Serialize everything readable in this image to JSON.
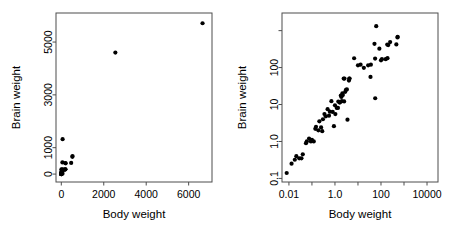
{
  "figure": {
    "background": "#ffffff",
    "point_color": "#000000",
    "axis_color": "#4d4d4d",
    "point_radius_px": 2.1
  },
  "chart_data": [
    {
      "id": "left-panel",
      "type": "scatter",
      "title": "",
      "xlabel": "Body weight",
      "ylabel": "Brain weight",
      "xscale": "linear",
      "yscale": "linear",
      "xlim": [
        -250,
        7100
      ],
      "ylim": [
        -300,
        6100
      ],
      "xticks": [
        0,
        2000,
        4000,
        6000
      ],
      "xticklabels": [
        "0",
        "2000",
        "4000",
        "6000"
      ],
      "yticks": [
        0,
        1000,
        3000,
        5000
      ],
      "yticklabels": [
        "0",
        "1000",
        "3000",
        "5000"
      ],
      "grid": false,
      "legend": null,
      "points": [
        [
          1.35,
          8.1
        ],
        [
          465,
          423
        ],
        [
          36.33,
          119.5
        ],
        [
          27.66,
          115
        ],
        [
          1.04,
          5.5
        ],
        [
          11700,
          50
        ],
        [
          2547,
          4603
        ],
        [
          187.1,
          419
        ],
        [
          521,
          655
        ],
        [
          10,
          115
        ],
        [
          3.3,
          25.6
        ],
        [
          529,
          680
        ],
        [
          207,
          406
        ],
        [
          62,
          1320
        ],
        [
          6654,
          5712
        ],
        [
          9400,
          70
        ],
        [
          6.8,
          179
        ],
        [
          35,
          56
        ],
        [
          0.12,
          1
        ],
        [
          0.023,
          0.4
        ],
        [
          2.5,
          12.1
        ],
        [
          55.5,
          175
        ],
        [
          100,
          157
        ],
        [
          52.16,
          440
        ],
        [
          87000,
          154.5
        ],
        [
          0.28,
          1.9
        ],
        [
          56,
          14.8
        ],
        [
          192,
          180
        ],
        [
          3,
          25
        ],
        [
          4.288,
          50.4
        ],
        [
          0.075,
          1.2
        ],
        [
          0.122,
          3
        ],
        [
          192,
          180
        ],
        [
          160,
          169
        ],
        [
          2.4,
          50.4
        ],
        [
          0.9,
          2.6
        ],
        [
          1.62,
          11.4
        ],
        [
          0.104,
          2.5
        ],
        [
          4.235,
          50.4
        ]
      ],
      "n_points": 39,
      "note": "Animals dataset: body weight (kg) vs brain weight (g)"
    },
    {
      "id": "right-panel",
      "type": "scatter",
      "title": "",
      "xlabel": "Body weight",
      "ylabel": "Brain weight",
      "xscale": "log",
      "yscale": "log",
      "xlim": [
        0.005,
        30000
      ],
      "ylim": [
        0.08,
        3000
      ],
      "xticks": [
        0.01,
        1.0,
        100,
        10000
      ],
      "xticklabels": [
        "0.01",
        "1.0",
        "100",
        "10000"
      ],
      "xticks_minor": [
        0.1,
        10,
        1000
      ],
      "yticks": [
        0.1,
        1.0,
        10,
        100
      ],
      "yticklabels": [
        "0.1",
        "1.0",
        "10",
        "100"
      ],
      "yticks_minor": [
        1000
      ],
      "grid": false,
      "legend": null,
      "points": [
        [
          0.008,
          0.14
        ],
        [
          0.013,
          0.25
        ],
        [
          0.018,
          0.32
        ],
        [
          0.021,
          0.4
        ],
        [
          0.028,
          0.35
        ],
        [
          0.035,
          0.35
        ],
        [
          0.04,
          0.45
        ],
        [
          0.055,
          0.9
        ],
        [
          0.06,
          1.0
        ],
        [
          0.075,
          1.2
        ],
        [
          0.09,
          1.0
        ],
        [
          0.1,
          1.1
        ],
        [
          0.12,
          1.0
        ],
        [
          0.14,
          2.2
        ],
        [
          0.15,
          2.5
        ],
        [
          0.19,
          2.0
        ],
        [
          0.21,
          3.5
        ],
        [
          0.25,
          2.4
        ],
        [
          0.28,
          1.9
        ],
        [
          0.3,
          4.0
        ],
        [
          0.35,
          5.5
        ],
        [
          0.4,
          4.8
        ],
        [
          0.48,
          7.5
        ],
        [
          0.55,
          5.0
        ],
        [
          0.6,
          6.4
        ],
        [
          0.7,
          12.3
        ],
        [
          0.8,
          6.3
        ],
        [
          0.9,
          2.6
        ],
        [
          1.0,
          9.5
        ],
        [
          1.04,
          5.5
        ],
        [
          1.2,
          8.1
        ],
        [
          1.35,
          8.1
        ],
        [
          1.4,
          12.0
        ],
        [
          1.6,
          11.4
        ],
        [
          1.62,
          11.4
        ],
        [
          1.8,
          17.5
        ],
        [
          1.9,
          16.0
        ],
        [
          2.0,
          12.3
        ],
        [
          2.1,
          20.0
        ],
        [
          2.2,
          18.0
        ],
        [
          2.4,
          50.4
        ],
        [
          2.5,
          12.1
        ],
        [
          2.6,
          50.4
        ],
        [
          2.8,
          22.0
        ],
        [
          3.0,
          25.0
        ],
        [
          3.3,
          25.6
        ],
        [
          3.5,
          3.9
        ],
        [
          4.05,
          44.5
        ],
        [
          4.23,
          50.4
        ],
        [
          4.29,
          50.4
        ],
        [
          6.8,
          179.0
        ],
        [
          10.0,
          115.0
        ],
        [
          13.0,
          119.5
        ],
        [
          18.0,
          98.2
        ],
        [
          27.66,
          115.0
        ],
        [
          35.0,
          56.0
        ],
        [
          36.33,
          119.5
        ],
        [
          52.16,
          440.0
        ],
        [
          55.5,
          175.0
        ],
        [
          56.0,
          14.8
        ],
        [
          62.0,
          1320.0
        ],
        [
          85.0,
          325.0
        ],
        [
          100.0,
          157.0
        ],
        [
          110.0,
          169.0
        ],
        [
          160.0,
          169.0
        ],
        [
          187.1,
          419.0
        ],
        [
          192.0,
          180.0
        ],
        [
          207.0,
          406.0
        ],
        [
          250.0,
          490.0
        ],
        [
          465.0,
          423.0
        ],
        [
          521.0,
          655.0
        ],
        [
          529.0,
          680.0
        ],
        [
          2547.0,
          4603.0
        ],
        [
          6654.0,
          5712.0
        ]
      ],
      "n_points": 74,
      "note": "Animals dataset on log-log axes"
    }
  ]
}
